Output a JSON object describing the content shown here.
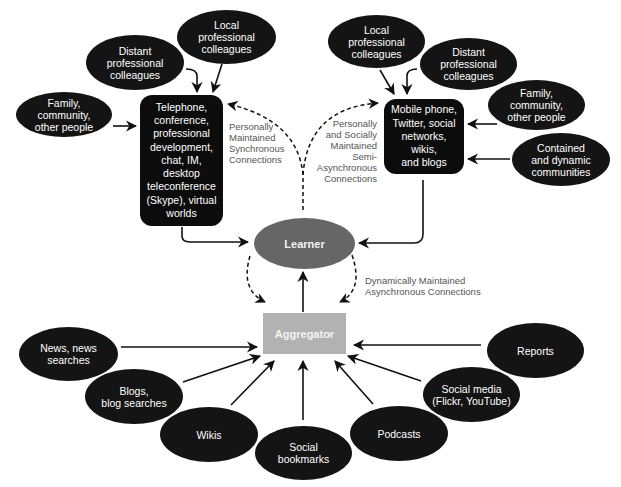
{
  "diagram": {
    "colors": {
      "node_fill": "#141414",
      "learner_fill": "#666666",
      "aggregator_fill": "#b2b2b2",
      "label_text": "#555555",
      "node_text": "#ffffff"
    },
    "synchronous": {
      "hub": "Telephone,\nconference,\nprofessional\ndevelopment,\nchat, IM,\ndesktop\nteleconference\n(Skype), virtual\nworlds",
      "sources": {
        "family": "Family,\ncommunity,\nother people",
        "distant": "Distant\nprofessional\ncolleagues",
        "local": "Local\nprofessional\ncolleagues"
      },
      "connection_label": "Personally\nMaintained\nSynchronous\nConnections"
    },
    "semi_asynchronous": {
      "hub": "Mobile phone,\nTwitter, social\nnetworks, wikis,\nand blogs",
      "sources": {
        "local": "Local\nprofessional\ncolleagues",
        "distant": "Distant\nprofessional\ncolleagues",
        "family": "Family,\ncommunity,\nother people",
        "communities": "Contained\nand dynamic\ncommunities"
      },
      "connection_label": "Personally\nand Socially\nMaintained\nSemi-\nAsynchronous\nConnections"
    },
    "learner": {
      "label": "Learner"
    },
    "aggregator": {
      "label": "Aggregator",
      "connection_label": "Dynamically Maintained\nAsynchronous Connections",
      "sources": {
        "news": "News, news\nsearches",
        "blogs": "Blogs,\nblog searches",
        "wikis": "Wikis",
        "bookmarks": "Social\nbookmarks",
        "podcasts": "Podcasts",
        "social_media": "Social media\n(Flickr, YouTube)",
        "reports": "Reports"
      }
    }
  }
}
